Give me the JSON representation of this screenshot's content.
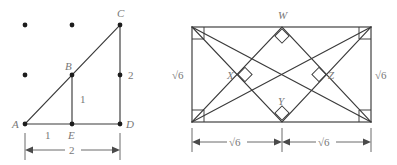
{
  "figure_left": {
    "name": "lattice-right-triangle",
    "vertex_labels": [
      "A",
      "B",
      "C",
      "D",
      "E"
    ],
    "points": {
      "A": "A",
      "B": "B",
      "C": "C",
      "D": "D",
      "E": "E"
    },
    "segment_labels": {
      "ae": "1",
      "be": "1",
      "cd_upper": "2"
    },
    "dimension_label": "2",
    "lattice_dot_count": 3
  },
  "figure_right": {
    "name": "rectangle-with-inscribed-right-angles",
    "vertex_labels": [
      "W",
      "X",
      "Y",
      "Z"
    ],
    "points": {
      "W": "W",
      "X": "X",
      "Y": "Y",
      "Z": "Z"
    },
    "side_labels": {
      "left": "√6",
      "right": "√6"
    },
    "dimension_labels": {
      "bottom_left": "√6",
      "bottom_right": "√6"
    },
    "right_angle_marker_count": 8
  },
  "colors": {
    "stroke": "#3a3a3a",
    "label": "#787878",
    "dot": "#1d1d1d",
    "background": "#ffffff"
  }
}
